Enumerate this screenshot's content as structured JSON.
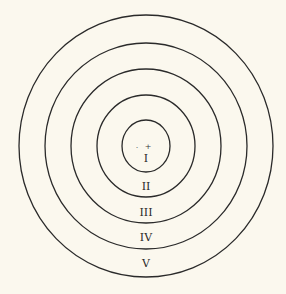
{
  "diagram": {
    "type": "concentric-zones",
    "center": {
      "x": 146,
      "y": 146
    },
    "rings": [
      {
        "label": "I",
        "rx": 24,
        "ry": 26,
        "label_y": 162
      },
      {
        "label": "II",
        "rx": 49,
        "ry": 51,
        "label_y": 190
      },
      {
        "label": "III",
        "rx": 75,
        "ry": 77,
        "label_y": 216
      },
      {
        "label": "IV",
        "rx": 101,
        "ry": 103,
        "label_y": 241
      },
      {
        "label": "V",
        "rx": 127,
        "ry": 131,
        "label_y": 267
      }
    ],
    "center_markers": {
      "plus": "+",
      "dot": "·"
    },
    "stroke_color": "#2a2a2a",
    "background_color": "#fbf8ee"
  }
}
